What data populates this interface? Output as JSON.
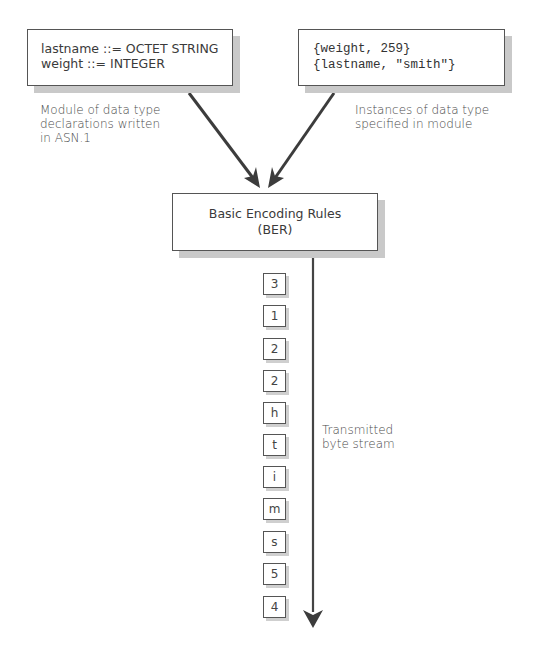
{
  "diagram": {
    "type": "flow",
    "module_box": {
      "lines": [
        "lastname ::= OCTET STRING",
        "weight ::= INTEGER"
      ]
    },
    "module_caption": {
      "lines": [
        "Module of data type",
        "declarations written",
        "in ASN.1"
      ]
    },
    "instances_box": {
      "lines": [
        "{weight, 259}",
        "{lastname, \"smith\"}"
      ]
    },
    "instances_caption": {
      "lines": [
        "Instances of data type",
        "specified in module"
      ]
    },
    "encoder_box": {
      "lines": [
        "Basic Encoding Rules",
        "(BER)"
      ]
    },
    "byte_stream": {
      "bytes": [
        "3",
        "1",
        "2",
        "2",
        "h",
        "t",
        "i",
        "m",
        "s",
        "5",
        "4"
      ],
      "label_lines": [
        "Transmitted",
        "byte stream"
      ]
    },
    "edges": [
      {
        "from": "module_box",
        "to": "encoder_box"
      },
      {
        "from": "instances_box",
        "to": "encoder_box"
      },
      {
        "from": "encoder_box",
        "to": "byte_stream"
      }
    ],
    "colors": {
      "stroke": "#555555",
      "arrow": "#3c3c3c",
      "shadow": "#c9c9c9",
      "text": "#3a3a3a"
    }
  }
}
